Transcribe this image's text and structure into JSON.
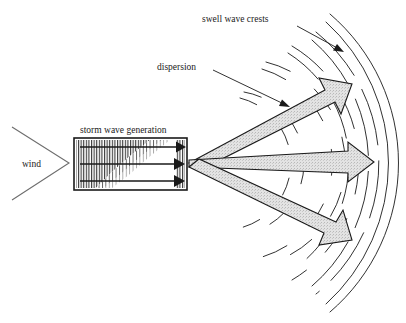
{
  "figure": {
    "title_present": false,
    "background_color": "#ffffff",
    "ink_color": "#1a1a1a",
    "arrow_fill_color": "#dedede",
    "arrow_stroke_color": "#1a1a1a",
    "hatch_color": "#2a2a2a"
  },
  "labels": {
    "swell_wave_crests": "swell wave crests",
    "dispersion": "dispersion",
    "storm_wave_generation": "storm wave generation",
    "wind": "wind"
  },
  "diagram": {
    "type": "schematic",
    "wind_chevron": {
      "label": "wind",
      "tip_x": 68,
      "tip_y": 163,
      "top_x": 12,
      "top_y": 128,
      "bottom_x": 12,
      "bottom_y": 200
    },
    "storm_box": {
      "label": "storm wave generation",
      "x": 74,
      "y": 138,
      "width": 113,
      "height": 52,
      "hatched": true,
      "hatch_orientation": "vertical",
      "hatch_density_gradient": "dense at left, tapering toward lower right"
    },
    "generation_arrows": [
      {
        "name": "upper-generation-arrow",
        "x1": 80,
        "y1": 147,
        "x2": 182,
        "y2": 147
      },
      {
        "name": "middle-generation-arrow",
        "x1": 80,
        "y1": 164,
        "x2": 182,
        "y2": 164
      },
      {
        "name": "lower-generation-arrow",
        "x1": 80,
        "y1": 181,
        "x2": 182,
        "y2": 181
      }
    ],
    "swell_origin": {
      "x": 188,
      "y": 163
    },
    "swell_arrows": [
      {
        "name": "upper-swell-arrow",
        "angle_deg": -32,
        "tip_x": 348,
        "tip_y": 63
      },
      {
        "name": "middle-swell-arrow",
        "angle_deg": 0,
        "tip_x": 372,
        "tip_y": 163
      },
      {
        "name": "lower-swell-arrow",
        "angle_deg": 33,
        "tip_x": 349,
        "tip_y": 248
      }
    ],
    "wave_crest_arcs": {
      "count": 5,
      "style": "double parallel lines, outer arcs continuous, inner arcs broken",
      "center_x": 188,
      "center_y": 163,
      "radii": [
        72,
        104,
        136,
        168,
        196
      ]
    },
    "leader_lines": [
      {
        "name": "swell-wave-crests-leader",
        "from_x": 298,
        "from_y": 26,
        "to_x": 344,
        "to_y": 52
      },
      {
        "name": "dispersion-leader",
        "from_x": 214,
        "from_y": 70,
        "to_x": 290,
        "to_y": 108
      }
    ]
  }
}
